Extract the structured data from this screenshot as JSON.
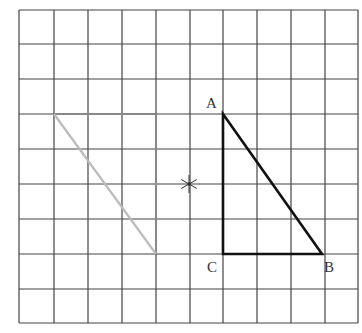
{
  "figure": {
    "width": 362,
    "height": 333,
    "grid": {
      "columns": 10,
      "rows": 9,
      "x_lines": [
        19,
        54,
        88,
        122,
        156,
        190,
        223,
        257,
        291,
        325,
        358
      ],
      "y_lines": [
        10,
        44,
        79,
        114,
        149,
        184,
        219,
        254,
        289,
        323
      ],
      "color": "#444444"
    },
    "triangle_abc": {
      "color": "#111111",
      "vertices": {
        "A": {
          "x": 223,
          "y": 114,
          "grid": [
            6,
            3
          ]
        },
        "B": {
          "x": 322,
          "y": 254,
          "grid": [
            9,
            7
          ]
        },
        "C": {
          "x": 223,
          "y": 254,
          "grid": [
            6,
            7
          ]
        }
      },
      "labels": {
        "A": "A",
        "B": "B",
        "C": "C"
      }
    },
    "image_triangle": {
      "color": "#bbbbbb",
      "edge_color": "#888888",
      "vertices": [
        {
          "x": 54,
          "y": 114,
          "grid": [
            1,
            3
          ]
        },
        {
          "x": 156,
          "y": 114,
          "grid": [
            4,
            3
          ]
        },
        {
          "x": 156,
          "y": 254,
          "grid": [
            4,
            7
          ]
        }
      ]
    },
    "center_mark": {
      "symbol": "star",
      "x": 189,
      "y": 184,
      "color": "#333333"
    }
  }
}
